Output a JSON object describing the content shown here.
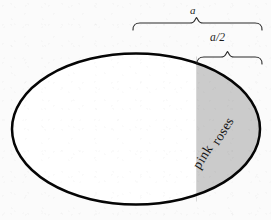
{
  "figure": {
    "type": "geometry-diagram",
    "width": 271,
    "height": 220,
    "background_color": "#fbfbfb"
  },
  "ellipse": {
    "center_x": 136,
    "center_y": 129,
    "radius_x": 125,
    "radius_y": 76,
    "stroke_color": "#000000",
    "stroke_width": 2.4,
    "fill_color": "#ffffff"
  },
  "shaded_region": {
    "name": "pink-roses-region",
    "fill_color": "#cbcbcb",
    "left_boundary_x": 196,
    "right_boundary_x": 261,
    "label_line_1": "pink",
    "label_line_2": "roses",
    "label_rotation_deg": -58
  },
  "measurements": [
    {
      "id": "full-width",
      "label": "a",
      "bracket_left_x": 133,
      "bracket_right_x": 262,
      "bracket_y": 22,
      "label_x": 195,
      "label_y": 11
    },
    {
      "id": "half-width",
      "label": "a/2",
      "bracket_left_x": 197,
      "bracket_right_x": 262,
      "bracket_y": 57,
      "label_x": 222,
      "label_y": 39
    }
  ],
  "brackets": {
    "stroke_color": "#2a2a2a",
    "stroke_width": 1.1
  },
  "watermark": {
    "text": "pink roses",
    "color": "#787682"
  }
}
